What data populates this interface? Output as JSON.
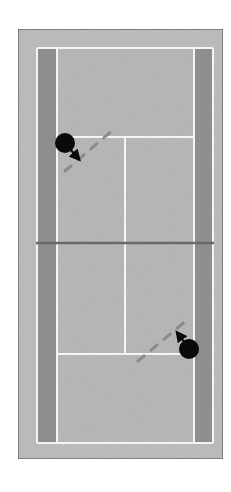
{
  "diagram": {
    "type": "tennis-court-top-view",
    "colors": {
      "background": "#ffffff",
      "surround": "#c2c2c2",
      "surround_border": "#6e6e6e",
      "court_surface": "#bdbdbd",
      "doubles_alley": "#8e8e8e",
      "lines": "#f4f4f4",
      "net": "#6a6a6a",
      "player": "#0a0a0a",
      "path_dash": "#8a8a8a"
    },
    "court": {
      "surround": {
        "x": 18,
        "y": 29,
        "w": 205,
        "h": 430
      },
      "outer_lines": {
        "x": 37,
        "y": 48,
        "w": 176,
        "h": 395
      },
      "left_alley": {
        "x": 38,
        "y": 49,
        "w": 18,
        "h": 393
      },
      "right_alley": {
        "x": 195,
        "y": 49,
        "w": 17,
        "h": 393
      },
      "singles_left_x": 57,
      "singles_right_x": 194,
      "top_service_line_y": 137,
      "bottom_service_line_y": 354,
      "center_line_x": 125,
      "net_y": 243,
      "net_x1": 36,
      "net_x2": 214
    },
    "players": [
      {
        "id": "player-top",
        "cx": 65,
        "cy": 143,
        "r": 10,
        "arrow": {
          "x1": 70,
          "y1": 149,
          "x2": 77,
          "y2": 157
        },
        "path": {
          "x1": 65,
          "y1": 171,
          "x2": 113,
          "y2": 130
        }
      },
      {
        "id": "player-bottom",
        "cx": 189,
        "cy": 349,
        "r": 10,
        "arrow": {
          "x1": 185,
          "y1": 343,
          "x2": 179,
          "y2": 335
        },
        "path": {
          "x1": 138,
          "y1": 361,
          "x2": 187,
          "y2": 320
        }
      }
    ]
  }
}
